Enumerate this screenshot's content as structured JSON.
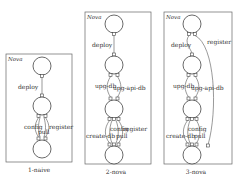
{
  "panels": [
    {
      "id": "1-naive",
      "title": "Nova",
      "caption": "1-naive",
      "labels": {
        "deploy": "deploy",
        "config": "config",
        "register": "register",
        "pull": "pull"
      }
    },
    {
      "id": "2-nova",
      "title": "Nova",
      "caption": "2-nova",
      "labels": {
        "deploy": "deploy",
        "upg_db": "upg-db",
        "upg_api_db": "upg-api-db",
        "config": "config",
        "register": "register",
        "create_db": "create-db",
        "pull": "pull"
      }
    },
    {
      "id": "3-nova",
      "title": "Nova",
      "caption": "3-nova",
      "labels": {
        "deploy": "deploy",
        "register": "register",
        "upg_db": "upg-db",
        "upg_api_db": "upg-api-db",
        "config": "config",
        "create_db": "create-db",
        "pull": "pull"
      }
    }
  ]
}
